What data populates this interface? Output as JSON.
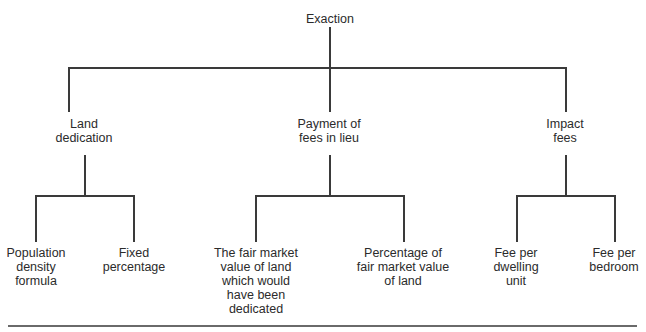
{
  "root": {
    "label": "Exaction"
  },
  "categories": [
    {
      "label": "Land\ndedication",
      "children": [
        {
          "label": "Population\ndensity\nformula"
        },
        {
          "label": "Fixed\npercentage"
        }
      ]
    },
    {
      "label": "Payment of\nfees in lieu",
      "children": [
        {
          "label": "The fair market\nvalue of land\nwhich would\nhave been\ndedicated"
        },
        {
          "label": "Percentage of\nfair market value\nof land"
        }
      ]
    },
    {
      "label": "Impact\nfees",
      "children": [
        {
          "label": "Fee per\ndwelling\nunit"
        },
        {
          "label": "Fee per\nbedroom"
        }
      ]
    }
  ]
}
